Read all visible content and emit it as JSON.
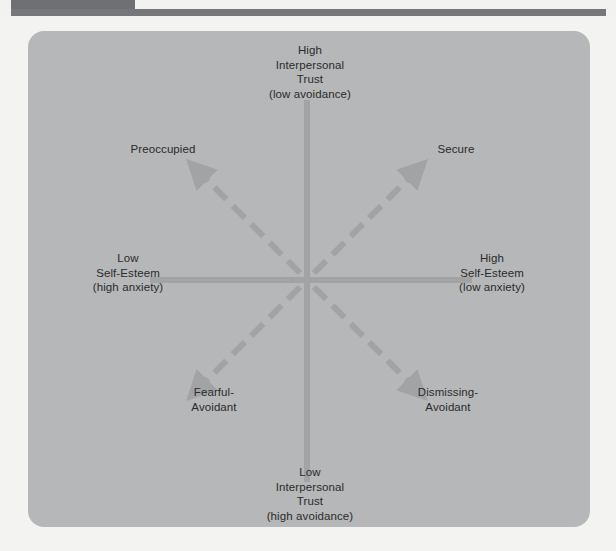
{
  "figure": {
    "type": "quadrant-diagram",
    "title_visible": false,
    "colors": {
      "page_background": "#f3f3f1",
      "panel_background": "#b6b7b8",
      "axis_line": "#a2a3a4",
      "arrow": "#a2a3a4",
      "text": "#2b2b2b",
      "top_tab": "#6f7073",
      "top_rule": "#76777a"
    },
    "axes": {
      "vertical": {
        "name": "interpersonal-trust-avoidance-axis",
        "top_label": {
          "lines": [
            "High",
            "Interpersonal",
            "Trust",
            "(low avoidance)"
          ]
        },
        "bottom_label": {
          "lines": [
            "Low",
            "Interpersonal",
            "Trust",
            "(high avoidance)"
          ]
        }
      },
      "horizontal": {
        "name": "self-esteem-anxiety-axis",
        "left_label": {
          "lines": [
            "Low",
            "Self-Esteem",
            "(high anxiety)"
          ]
        },
        "right_label": {
          "lines": [
            "High",
            "Self-Esteem",
            "(low anxiety)"
          ]
        }
      }
    },
    "quadrants": [
      {
        "id": "preoccupied",
        "position": "top-left",
        "lines": [
          "Preoccupied"
        ],
        "arrow_direction": "up-left"
      },
      {
        "id": "secure",
        "position": "top-right",
        "lines": [
          "Secure"
        ],
        "arrow_direction": "up-right"
      },
      {
        "id": "fearful-avoidant",
        "position": "bottom-left",
        "lines": [
          "Fearful-",
          "Avoidant"
        ],
        "arrow_direction": "down-left"
      },
      {
        "id": "dismissing-avoidant",
        "position": "bottom-right",
        "lines": [
          "Dismissing-",
          "Avoidant"
        ],
        "arrow_direction": "down-right"
      }
    ]
  },
  "labels": {
    "top": {
      "l1": "High",
      "l2": "Interpersonal",
      "l3": "Trust",
      "l4": "(low avoidance)"
    },
    "bottom": {
      "l1": "Low",
      "l2": "Interpersonal",
      "l3": "Trust",
      "l4": "(high avoidance)"
    },
    "left": {
      "l1": "Low",
      "l2": "Self-Esteem",
      "l3": "(high anxiety)"
    },
    "right": {
      "l1": "High",
      "l2": "Self-Esteem",
      "l3": "(low anxiety)"
    },
    "preoccupied": {
      "l1": "Preoccupied"
    },
    "secure": {
      "l1": "Secure"
    },
    "fearful": {
      "l1": "Fearful-",
      "l2": "Avoidant"
    },
    "dismissing": {
      "l1": "Dismissing-",
      "l2": "Avoidant"
    }
  }
}
